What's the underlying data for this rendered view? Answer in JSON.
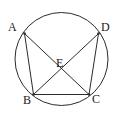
{
  "figure": {
    "background_color": "#ffffff",
    "stroke_color": "#2b2b2b",
    "label_color": "#222222",
    "circle": {
      "name": "circumscribed-circle",
      "cx": 61.5,
      "cy": 59,
      "r": 46.5,
      "stroke_width": 1
    },
    "points": [
      {
        "id": "A",
        "label": "A",
        "x": 24.5,
        "y": 33.5,
        "label_x": 8,
        "label_y": 21
      },
      {
        "id": "D",
        "label": "D",
        "x": 98.5,
        "y": 33.5,
        "label_x": 101,
        "label_y": 21
      },
      {
        "id": "B",
        "label": "B",
        "x": 33.5,
        "y": 94.5,
        "label_x": 23,
        "label_y": 94
      },
      {
        "id": "C",
        "label": "C",
        "x": 89.0,
        "y": 94.5,
        "label_x": 92,
        "label_y": 93
      },
      {
        "id": "E",
        "label": "E",
        "x": 61.5,
        "y": 72.5,
        "label_x": 56,
        "label_y": 57
      }
    ],
    "segments": [
      {
        "id": "AB",
        "from": "A",
        "to": "B",
        "x1": 24.5,
        "y1": 33.5,
        "x2": 33.5,
        "y2": 94.5
      },
      {
        "id": "AC",
        "from": "A",
        "to": "C",
        "x1": 24.5,
        "y1": 33.5,
        "x2": 89.0,
        "y2": 94.5
      },
      {
        "id": "DB",
        "from": "D",
        "to": "B",
        "x1": 98.5,
        "y1": 33.5,
        "x2": 33.5,
        "y2": 94.5
      },
      {
        "id": "DC",
        "from": "D",
        "to": "C",
        "x1": 98.5,
        "y1": 33.5,
        "x2": 89.0,
        "y2": 94.5
      },
      {
        "id": "BC",
        "from": "B",
        "to": "C",
        "x1": 33.5,
        "y1": 94.5,
        "x2": 89.0,
        "y2": 94.5
      }
    ]
  }
}
